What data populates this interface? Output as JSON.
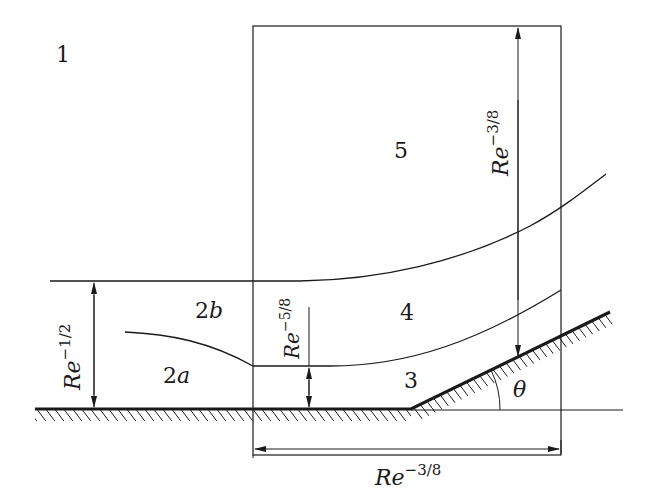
{
  "diagram": {
    "regions": {
      "r1": "1",
      "r2a_num": "2",
      "r2a_sub": "a",
      "r2b_num": "2",
      "r2b_sub": "b",
      "r3": "3",
      "r4": "4",
      "r5": "5"
    },
    "angle_label": "θ",
    "dimensions": {
      "boundary_layer": {
        "base": "Re",
        "exponent": "−1/2"
      },
      "sublayer": {
        "base": "Re",
        "exponent": "−5/8"
      },
      "vertical_interaction": {
        "base": "Re",
        "exponent": "−3/8"
      },
      "horizontal_interaction": {
        "base": "Re",
        "exponent": "−3/8"
      }
    },
    "colors": {
      "ink": "#1a1a1a",
      "background": "#ffffff"
    }
  }
}
